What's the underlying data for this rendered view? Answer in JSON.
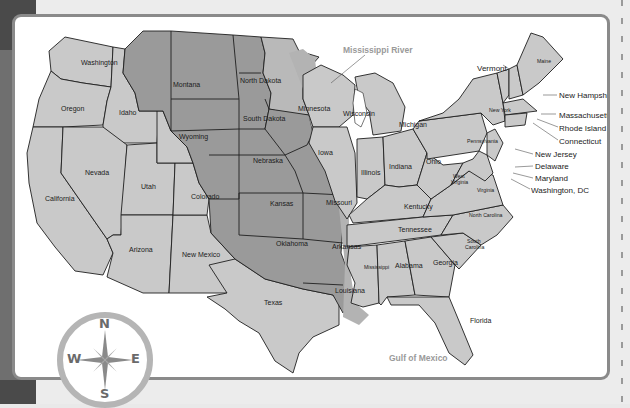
{
  "map": {
    "title_annotation": "Mississippi River",
    "water_labels": {
      "gulf": "Gulf of Mexico"
    },
    "colors": {
      "state_fill": "#c9c9c9",
      "purchase_fill": "#9a9a9a",
      "river_basin_fill": "#b3b3b3",
      "border": "#1f1f1f",
      "frame": "#8a8a8a",
      "page_bg": "#ececec",
      "left_strip": "#6f6f6f"
    },
    "states": {
      "washington": "Washington",
      "oregon": "Oregon",
      "idaho": "Idaho",
      "montana": "Montana",
      "wyoming": "Wyoming",
      "california": "California",
      "nevada": "Nevada",
      "utah": "Utah",
      "colorado": "Colorado",
      "arizona": "Arizona",
      "new_mexico": "New Mexico",
      "north_dakota": "North Dakota",
      "south_dakota": "South Dakota",
      "nebraska": "Nebraska",
      "kansas": "Kansas",
      "oklahoma": "Oklahoma",
      "texas": "Texas",
      "minnesota": "Minnesota",
      "iowa": "Iowa",
      "missouri": "Missouri",
      "arkansas": "Arkansas",
      "louisiana": "Louisiana",
      "wisconsin": "Wisconsin",
      "illinois": "Illinois",
      "michigan": "Michigan",
      "indiana": "Indiana",
      "ohio": "Ohio",
      "kentucky": "Kentucky",
      "tennessee": "Tennessee",
      "mississippi": "Mississippi",
      "alabama": "Alabama",
      "georgia": "Georgia",
      "florida": "Florida",
      "south_carolina_1": "South",
      "south_carolina_2": "Carolina",
      "north_carolina": "North Carolina",
      "virginia": "Virginia",
      "west_virginia_1": "West",
      "west_virginia_2": "Virginia",
      "pennsylvania": "Pennsylvania",
      "new_york": "New York",
      "maine": "Maine"
    },
    "callouts": {
      "vermont": "Vermont",
      "new_hampshire": "New Hampshire",
      "massachusetts": "Massachusetts",
      "rhode_island": "Rhode Island",
      "connecticut": "Connecticut",
      "new_jersey": "New Jersey",
      "delaware": "Delaware",
      "maryland": "Maryland",
      "washington_dc": "Washington, DC"
    },
    "compass": {
      "north": "N",
      "south": "S",
      "east": "E",
      "west": "W"
    }
  }
}
